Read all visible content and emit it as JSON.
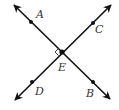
{
  "diagram": {
    "type": "perpendicular-lines",
    "stroke_color": "#111111",
    "label_color": "#333333",
    "intersection": {
      "label": "E",
      "x": 62,
      "y": 52,
      "label_x": 58,
      "label_y": 71
    },
    "lines": [
      {
        "name": "line-AB",
        "from": {
          "x": 14,
          "y": 5
        },
        "to": {
          "x": 110,
          "y": 99
        }
      },
      {
        "name": "line-CD",
        "from": {
          "x": 111,
          "y": 5
        },
        "to": {
          "x": 15,
          "y": 100
        }
      }
    ],
    "points": [
      {
        "label": "A",
        "x": 31,
        "y": 22,
        "label_x": 36,
        "label_y": 18
      },
      {
        "label": "C",
        "x": 93,
        "y": 23,
        "label_x": 95,
        "label_y": 33
      },
      {
        "label": "D",
        "x": 32,
        "y": 82,
        "label_x": 35,
        "label_y": 95
      },
      {
        "label": "B",
        "x": 93,
        "y": 82,
        "label_x": 86,
        "label_y": 97
      }
    ],
    "right_angle_marker": {
      "at": "E",
      "side": "left",
      "size": 5
    }
  }
}
